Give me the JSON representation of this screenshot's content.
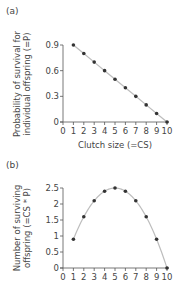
{
  "chart_data": [
    {
      "panel": "(a)",
      "type": "line",
      "title": "",
      "xlabel": "Clutch size (=CS)",
      "ylabel": [
        "Probability of survival for",
        "individual offspring (=P)"
      ],
      "x": [
        1,
        2,
        3,
        4,
        5,
        6,
        7,
        8,
        9,
        10
      ],
      "series": [
        {
          "name": "P",
          "values": [
            0.9,
            0.8,
            0.7,
            0.6,
            0.5,
            0.4,
            0.3,
            0.2,
            0.1,
            0.0
          ]
        }
      ],
      "xlim": [
        0,
        10
      ],
      "ylim": [
        0,
        0.9
      ],
      "xticks": [
        "0",
        "1",
        "2",
        "3",
        "4",
        "5",
        "6",
        "7",
        "8",
        "9",
        "10"
      ],
      "yticks": [
        "0",
        "0.3",
        "0.6",
        "0.9"
      ],
      "grid": false,
      "legend": null
    },
    {
      "panel": "(b)",
      "type": "line",
      "title": "",
      "xlabel": "",
      "ylabel": [
        "Number of surviving",
        "offspring (=CS * P)"
      ],
      "x": [
        1,
        2,
        3,
        4,
        5,
        6,
        7,
        8,
        9,
        10
      ],
      "series": [
        {
          "name": "CS * P",
          "values": [
            0.9,
            1.6,
            2.1,
            2.4,
            2.5,
            2.4,
            2.1,
            1.6,
            0.9,
            0.0
          ]
        }
      ],
      "xlim": [
        0,
        10
      ],
      "ylim": [
        0,
        2.5
      ],
      "xticks": [
        "0",
        "1",
        "2",
        "3",
        "4",
        "5",
        "6",
        "7",
        "8",
        "9",
        "10"
      ],
      "yticks": [
        "0",
        "0.5",
        "1",
        "1.5",
        "2",
        "2.5"
      ],
      "grid": false,
      "legend": null
    }
  ],
  "colors": {
    "line": "#bdbdbd",
    "marker": "#333333",
    "axis": "#555555",
    "text": "#444444"
  }
}
